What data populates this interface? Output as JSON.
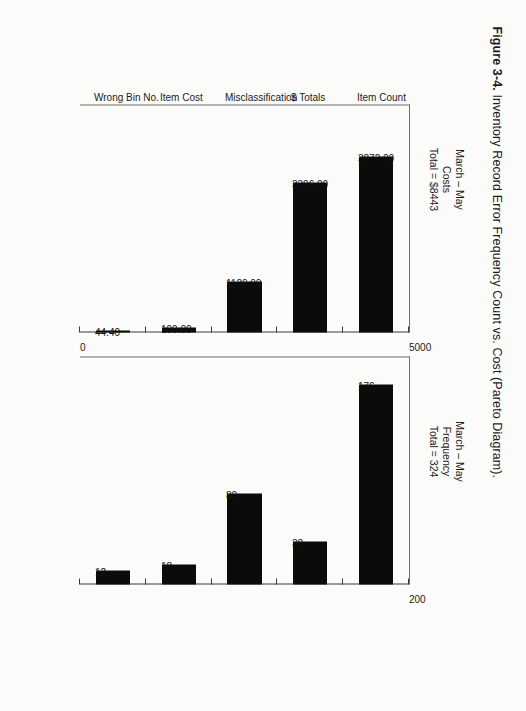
{
  "figure": {
    "number": "Figure 3-4.",
    "caption": "Inventory Record Error Frequency Count vs. Cost (Pareto Diagram)."
  },
  "panels": {
    "cost": {
      "subtitle_line1": "March – May",
      "subtitle_line2": "Costs",
      "subtitle_line3": "Total = $8443"
    },
    "frequency": {
      "subtitle_line1": "March – May",
      "subtitle_line2": "Frequency",
      "subtitle_line3": "Total = 324"
    }
  },
  "chart_data": [
    {
      "type": "bar",
      "title": "March – May Costs",
      "subtitle": "Total = $8443",
      "xlabel": "",
      "ylabel": "",
      "orientation": "vertical",
      "categories": [
        "Item Count",
        "$ Totals",
        "Misclassification",
        "Item Cost",
        "Wrong Bin No."
      ],
      "values": [
        3872.0,
        3306.0,
        1120.0,
        100.0,
        44.4
      ],
      "data_labels": [
        "3872.00",
        "3306.00",
        "1120.00",
        "100.00",
        "44.40"
      ],
      "ylim": [
        0,
        5000
      ],
      "yticks": [
        0,
        1000,
        2000,
        3000,
        4000,
        5000
      ],
      "ytick_labels": [
        "0",
        "",
        "",
        "",
        "",
        "5000"
      ],
      "grid": false,
      "legend": "none",
      "bar_color": "#0b0b0b"
    },
    {
      "type": "bar",
      "title": "March – May Frequency",
      "subtitle": "Total = 324",
      "xlabel": "",
      "ylabel": "",
      "orientation": "vertical",
      "categories": [
        "Item Count",
        "$ Totals",
        "Misclassification",
        "Item Cost",
        "Wrong Bin No."
      ],
      "values": [
        176,
        38,
        80,
        18,
        12
      ],
      "data_labels": [
        "176",
        "38",
        "80",
        "18",
        "12"
      ],
      "ylim": [
        0,
        200
      ],
      "yticks": [
        0,
        40,
        80,
        120,
        160,
        200
      ],
      "ytick_labels": [
        "",
        "",
        "",
        "",
        "",
        "200"
      ],
      "grid": false,
      "legend": "none",
      "bar_color": "#0b0b0b"
    }
  ],
  "axis_labels": {
    "cost_min": "0",
    "cost_max": "5000",
    "freq_max": "200"
  }
}
